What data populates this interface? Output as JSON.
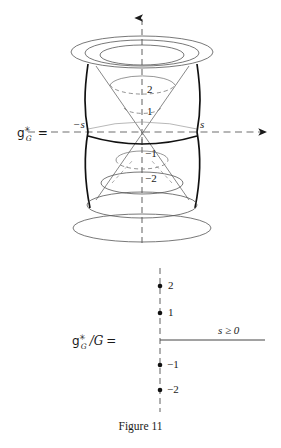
{
  "figure": {
    "caption": "Figure 11",
    "upper_panel": {
      "name": "dual-space-cone-diagram",
      "left_label": {
        "fraktur_g": "g",
        "superscript": "✳",
        "subscript": "G",
        "equals": "="
      },
      "axis_labels": {
        "negative_s": "−s",
        "positive_s": "s"
      },
      "level_labels": [
        "2",
        "1",
        "−1",
        "−2"
      ],
      "upper_level_labels": [
        "2",
        "1"
      ],
      "lower_level_labels": [
        "−1",
        "−2"
      ]
    },
    "lower_panel": {
      "name": "quotient-diagram",
      "left_label": {
        "fraktur_g": "g",
        "superscript": "✳",
        "subscript": "G",
        "quotient": "/G",
        "equals": "="
      },
      "ray_label": "s ≥ 0",
      "point_labels": [
        "2",
        "1",
        "−1",
        "−2"
      ]
    }
  },
  "colors": {
    "ink": "#1a1a1a",
    "thin": "#555555",
    "dash": "#777777",
    "background": "#ffffff"
  }
}
